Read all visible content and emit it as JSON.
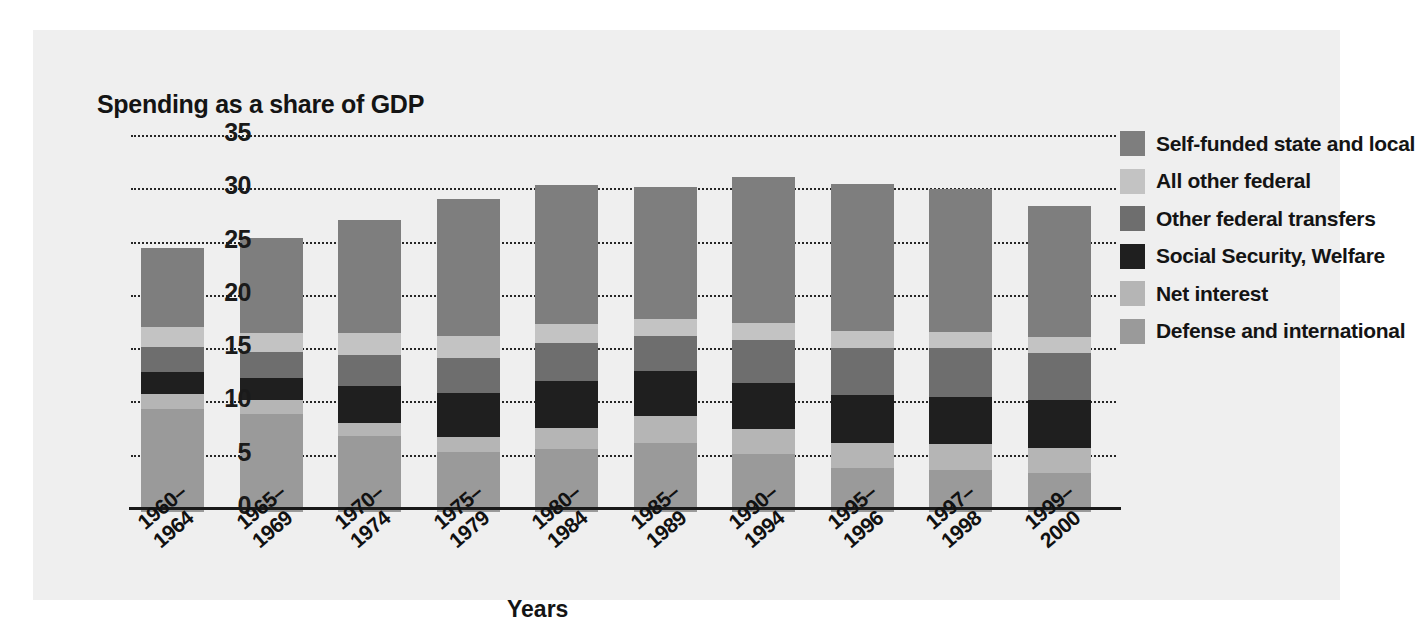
{
  "chart_data": {
    "type": "bar",
    "stacked": true,
    "title": "",
    "ylabel": "Spending as a share of GDP",
    "xlabel": "Years",
    "ylim": [
      0,
      35
    ],
    "yticks": [
      0,
      5,
      10,
      15,
      20,
      25,
      30,
      35
    ],
    "grid": true,
    "legend_position": "right",
    "categories": [
      "1960–\n1964",
      "1965–\n1969",
      "1970–\n1974",
      "1975–\n1979",
      "1980–\n1984",
      "1985–\n1989",
      "1990–\n1994",
      "1995–\n1996",
      "1997–\n1998",
      "1999–\n2000"
    ],
    "category_lines": [
      [
        "1960–",
        "1964"
      ],
      [
        "1965–",
        "1969"
      ],
      [
        "1970–",
        "1974"
      ],
      [
        "1975–",
        "1979"
      ],
      [
        "1980–",
        "1984"
      ],
      [
        "1985–",
        "1989"
      ],
      [
        "1990–",
        "1994"
      ],
      [
        "1995–",
        "1996"
      ],
      [
        "1997–",
        "1998"
      ],
      [
        "1999–",
        "2000"
      ]
    ],
    "series": [
      {
        "name": "Defense and international",
        "color": "#9a9a9a",
        "values": [
          9.7,
          9.2,
          7.1,
          5.6,
          5.9,
          6.5,
          5.4,
          4.1,
          3.9,
          3.7
        ]
      },
      {
        "name": "Net interest",
        "color": "#b5b5b5",
        "values": [
          1.4,
          1.3,
          1.3,
          1.4,
          2.0,
          2.5,
          2.4,
          2.4,
          2.5,
          2.3
        ]
      },
      {
        "name": "Social Security, Welfare",
        "color": "#1f1f1f",
        "values": [
          2.0,
          2.1,
          3.4,
          4.2,
          4.4,
          4.2,
          4.3,
          4.5,
          4.4,
          4.5
        ]
      },
      {
        "name": "Other federal transfers",
        "color": "#6e6e6e",
        "values": [
          2.4,
          2.4,
          2.9,
          3.3,
          3.6,
          3.3,
          4.0,
          4.4,
          4.6,
          4.4
        ]
      },
      {
        "name": "All other federal",
        "color": "#c3c3c3",
        "values": [
          1.9,
          1.8,
          2.1,
          2.0,
          1.7,
          1.6,
          1.6,
          1.6,
          1.5,
          1.5
        ]
      },
      {
        "name": "Self-funded state and local",
        "color": "#7e7e7e",
        "values": [
          7.4,
          8.9,
          10.6,
          12.9,
          13.1,
          12.4,
          13.7,
          13.8,
          13.4,
          12.3
        ]
      }
    ],
    "totals": [
      24.8,
      25.7,
      27.4,
      29.4,
      30.7,
      30.5,
      31.4,
      30.8,
      30.3,
      28.7
    ]
  },
  "legend": {
    "items": [
      {
        "label": "Self-funded state and local",
        "color": "#7e7e7e"
      },
      {
        "label": "All other federal",
        "color": "#c3c3c3"
      },
      {
        "label": "Other federal transfers",
        "color": "#6e6e6e"
      },
      {
        "label": "Social Security, Welfare",
        "color": "#1f1f1f"
      },
      {
        "label": "Net interest",
        "color": "#b5b5b5"
      },
      {
        "label": "Defense and international",
        "color": "#9a9a9a"
      }
    ]
  },
  "theme": {
    "panel_background": "#efefef",
    "page_background": "#ffffff",
    "axis_color": "#1a1a1a",
    "grid_color": "#262626",
    "text_color": "#141414"
  }
}
